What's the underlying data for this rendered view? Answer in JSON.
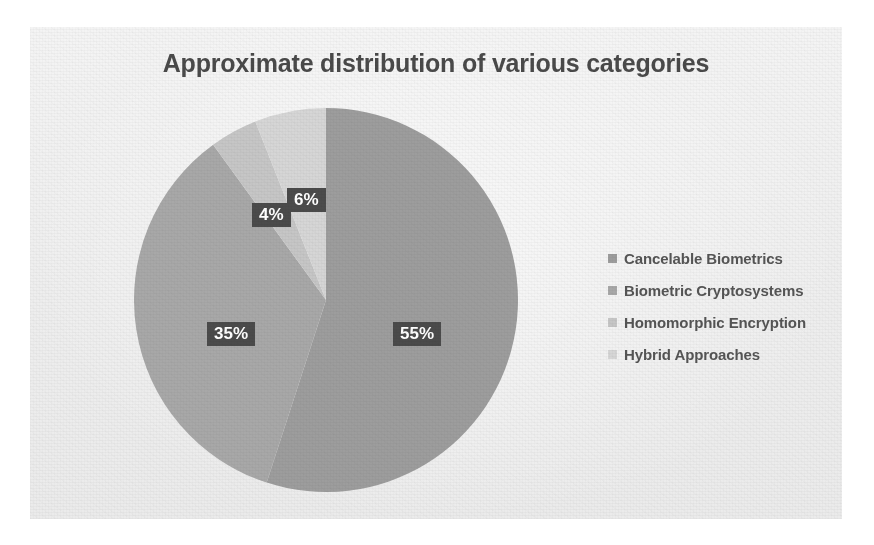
{
  "chart_data": {
    "type": "pie",
    "title": "Approximate distribution of various categories",
    "categories": [
      "Cancelable Biometrics",
      "Biometric Cryptosystems",
      "Homomorphic Encryption",
      "Hybrid Approaches"
    ],
    "values": [
      55,
      35,
      4,
      6
    ],
    "value_labels": [
      "55%",
      "35%",
      "4%",
      "6%"
    ],
    "units": "percent",
    "legend_position": "right",
    "grid": false,
    "start_angle_deg": 0,
    "direction": "clockwise",
    "slice_colors": [
      "#9d9d9d",
      "#a8a8a8",
      "#c6c6c6",
      "#d6d6d6"
    ],
    "label_box_color": "#4b4b4b",
    "label_text_color": "#ffffff",
    "title_color": "#4a4a4a",
    "legend_text_color": "#555555",
    "background_color": "#f1f1f1",
    "page_color": "#ffffff"
  },
  "chart": {
    "title": "Approximate distribution of various categories"
  },
  "labels": {
    "slice_1": "55%",
    "slice_2": "35%",
    "slice_3": "4%",
    "slice_4": "6%"
  },
  "legend": {
    "items": [
      {
        "label": "Cancelable Biometrics",
        "color": "#9d9d9d",
        "value": "55%"
      },
      {
        "label": "Biometric Cryptosystems",
        "color": "#a8a8a8",
        "value": "35%"
      },
      {
        "label": "Homomorphic Encryption",
        "color": "#c6c6c6",
        "value": "4%"
      },
      {
        "label": "Hybrid Approaches",
        "color": "#d6d6d6",
        "value": "6%"
      }
    ]
  }
}
